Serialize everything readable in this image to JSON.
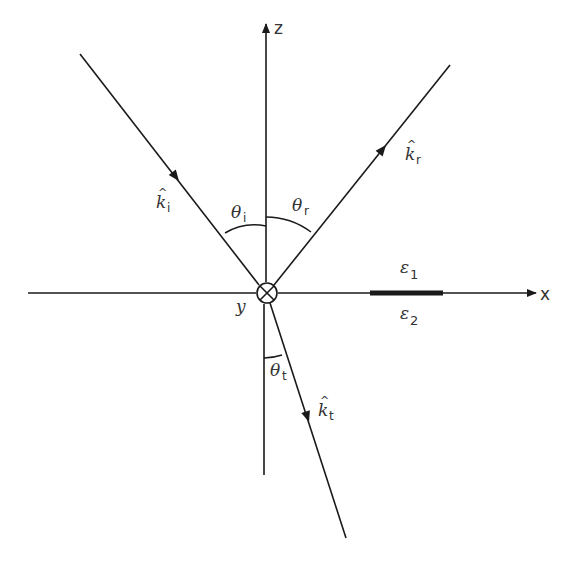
{
  "diagram": {
    "type": "reflection-refraction-at-interface",
    "axes": {
      "z_label": "z",
      "x_label": "x",
      "y_label": "y",
      "y_symbol": "into-page (⊗)"
    },
    "rays": {
      "incident": {
        "vector_label": "k",
        "subscript": "i",
        "angle_label": "θ",
        "angle_subscript": "i"
      },
      "reflected": {
        "vector_label": "k",
        "subscript": "r",
        "angle_label": "θ",
        "angle_subscript": "r"
      },
      "transmitted": {
        "vector_label": "k",
        "subscript": "t",
        "angle_label": "θ",
        "angle_subscript": "t"
      }
    },
    "media": {
      "upper": {
        "label": "ε",
        "subscript": "1"
      },
      "lower": {
        "label": "ε",
        "subscript": "2"
      }
    },
    "colors": {
      "line": "#1a1a1a",
      "background": "#ffffff"
    }
  }
}
